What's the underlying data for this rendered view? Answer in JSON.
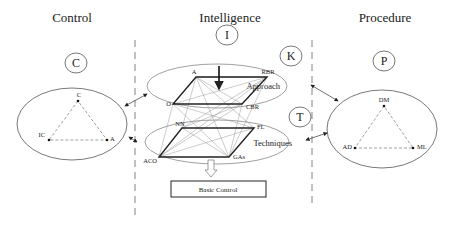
{
  "sections": {
    "control": {
      "title": "Control",
      "circle": "C",
      "nodes": [
        "C",
        "IC",
        "A"
      ]
    },
    "intelligence": {
      "title": "Intelligence",
      "circle": "I"
    },
    "procedure": {
      "title": "Procedure",
      "circle": "P",
      "nodes": [
        "DM",
        "AD",
        "ML"
      ]
    }
  },
  "approach": {
    "circle": "K",
    "label": "Approach",
    "nodes": [
      "A",
      "RBR",
      "O",
      "CBR"
    ]
  },
  "techniques": {
    "circle": "T",
    "label": "Techniques",
    "nodes": [
      "NN",
      "FL",
      "ACO",
      "GAs"
    ]
  },
  "output_box": {
    "label": "Basic Control"
  },
  "colors": {
    "line": "#333333",
    "thin": "#888888",
    "dash": "#666666"
  }
}
